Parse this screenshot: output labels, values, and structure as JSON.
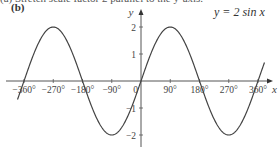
{
  "header": {
    "truncated_text": "(a)   Stretch scale factor 2 parallel to the y-axis.",
    "part_label": "(b)"
  },
  "chart_data": {
    "type": "line",
    "title": "y = 2 sin x",
    "xlabel": "x",
    "ylabel": "y",
    "function": "y = 2 sin x",
    "x_unit": "degrees",
    "xlim": [
      -360,
      360
    ],
    "ylim": [
      -2,
      2
    ],
    "x_ticks": [
      -360,
      -270,
      -180,
      -90,
      0,
      90,
      180,
      270,
      360
    ],
    "x_tick_labels": [
      "−360°",
      "−270°",
      "−180°",
      "−90°",
      "0",
      "90°",
      "180°",
      "270°",
      "360°"
    ],
    "y_ticks": [
      -2,
      -1,
      1,
      2
    ],
    "y_tick_labels": [
      "−2",
      "−1",
      "1",
      "2"
    ],
    "origin_label": "0",
    "grid": false,
    "legend": "none",
    "key_points": [
      {
        "x": -360,
        "y": 0
      },
      {
        "x": -270,
        "y": 2
      },
      {
        "x": -180,
        "y": 0
      },
      {
        "x": -90,
        "y": -2
      },
      {
        "x": 0,
        "y": 0
      },
      {
        "x": 90,
        "y": 2
      },
      {
        "x": 180,
        "y": 0
      },
      {
        "x": 270,
        "y": -2
      },
      {
        "x": 360,
        "y": 0
      }
    ],
    "series": [
      {
        "name": "y = 2 sin x",
        "amplitude": 2,
        "period": 360,
        "color": "#444444"
      }
    ]
  },
  "layout": {
    "origin_px": [
      141,
      81
    ],
    "px_per_90deg": 29.25,
    "px_per_unit": 27,
    "x_axis_px": [
      6,
      273
    ],
    "y_axis_px": [
      147,
      9
    ]
  }
}
